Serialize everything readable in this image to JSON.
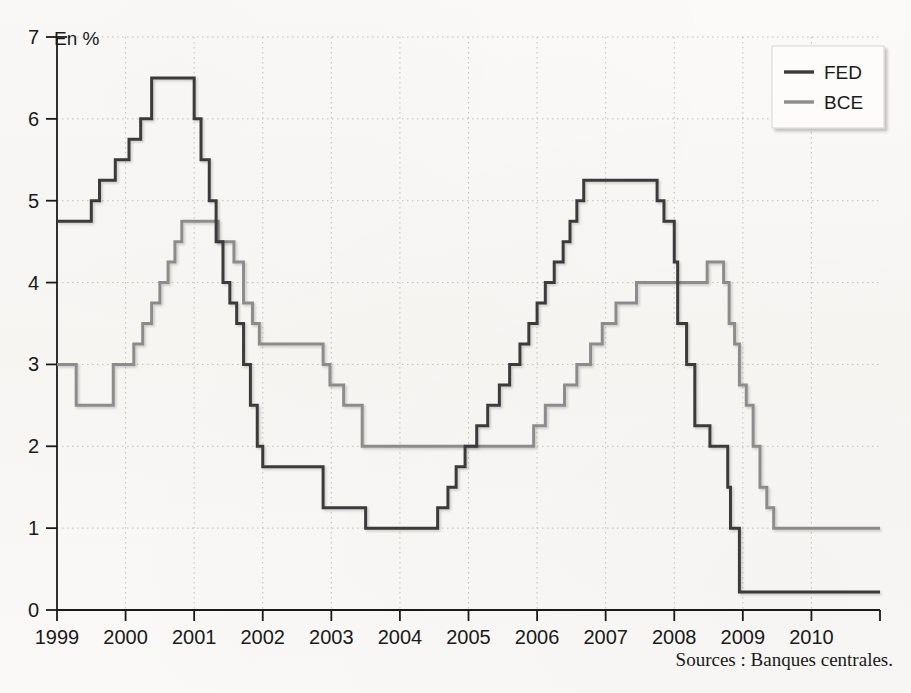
{
  "chart_data": {
    "type": "line",
    "title": "",
    "unit_label": "En %",
    "xlabel": "",
    "ylabel": "",
    "grid": true,
    "step": "post",
    "legend_position": "top-right",
    "xlim": [
      1999,
      2011
    ],
    "ylim": [
      0,
      7
    ],
    "x_ticks": [
      1999,
      2000,
      2001,
      2002,
      2003,
      2004,
      2005,
      2006,
      2007,
      2008,
      2009,
      2010
    ],
    "x_tick_labels": [
      "1999",
      "2000",
      "2001",
      "2002",
      "2003",
      "2004",
      "2005",
      "2006",
      "2007",
      "2008",
      "2009",
      "2010"
    ],
    "y_ticks": [
      0,
      1,
      2,
      3,
      4,
      5,
      6,
      7
    ],
    "y_tick_labels": [
      "0",
      "1",
      "2",
      "3",
      "4",
      "5",
      "6",
      "7"
    ],
    "series": [
      {
        "name": "FED",
        "color": "#3b3b3b",
        "width": 3.0,
        "points": [
          [
            1999.0,
            4.75
          ],
          [
            1999.5,
            5.0
          ],
          [
            1999.62,
            5.25
          ],
          [
            1999.85,
            5.5
          ],
          [
            2000.05,
            5.75
          ],
          [
            2000.22,
            6.0
          ],
          [
            2000.38,
            6.5
          ],
          [
            2001.0,
            6.0
          ],
          [
            2001.1,
            5.5
          ],
          [
            2001.22,
            5.0
          ],
          [
            2001.32,
            4.5
          ],
          [
            2001.42,
            4.0
          ],
          [
            2001.52,
            3.75
          ],
          [
            2001.62,
            3.5
          ],
          [
            2001.72,
            3.0
          ],
          [
            2001.82,
            2.5
          ],
          [
            2001.92,
            2.0
          ],
          [
            2002.0,
            1.75
          ],
          [
            2002.88,
            1.25
          ],
          [
            2003.5,
            1.0
          ],
          [
            2004.55,
            1.25
          ],
          [
            2004.7,
            1.5
          ],
          [
            2004.82,
            1.75
          ],
          [
            2004.95,
            2.0
          ],
          [
            2005.12,
            2.25
          ],
          [
            2005.28,
            2.5
          ],
          [
            2005.45,
            2.75
          ],
          [
            2005.6,
            3.0
          ],
          [
            2005.75,
            3.25
          ],
          [
            2005.88,
            3.5
          ],
          [
            2006.0,
            3.75
          ],
          [
            2006.12,
            4.0
          ],
          [
            2006.25,
            4.25
          ],
          [
            2006.38,
            4.5
          ],
          [
            2006.48,
            4.75
          ],
          [
            2006.58,
            5.0
          ],
          [
            2006.68,
            5.25
          ],
          [
            2007.75,
            5.0
          ],
          [
            2007.85,
            4.75
          ],
          [
            2008.0,
            4.25
          ],
          [
            2008.05,
            3.5
          ],
          [
            2008.18,
            3.0
          ],
          [
            2008.3,
            2.25
          ],
          [
            2008.52,
            2.0
          ],
          [
            2008.78,
            1.5
          ],
          [
            2008.82,
            1.0
          ],
          [
            2008.95,
            0.22
          ],
          [
            2011.0,
            0.22
          ]
        ]
      },
      {
        "name": "BCE",
        "color": "#8c8c8c",
        "width": 3.0,
        "points": [
          [
            1999.0,
            3.0
          ],
          [
            1999.28,
            2.5
          ],
          [
            1999.82,
            3.0
          ],
          [
            2000.12,
            3.25
          ],
          [
            2000.25,
            3.5
          ],
          [
            2000.38,
            3.75
          ],
          [
            2000.5,
            4.0
          ],
          [
            2000.62,
            4.25
          ],
          [
            2000.72,
            4.5
          ],
          [
            2000.82,
            4.75
          ],
          [
            2001.35,
            4.5
          ],
          [
            2001.58,
            4.25
          ],
          [
            2001.72,
            3.75
          ],
          [
            2001.85,
            3.5
          ],
          [
            2001.95,
            3.25
          ],
          [
            2002.88,
            3.0
          ],
          [
            2002.98,
            2.75
          ],
          [
            2003.18,
            2.5
          ],
          [
            2003.45,
            2.0
          ],
          [
            2005.95,
            2.25
          ],
          [
            2006.12,
            2.5
          ],
          [
            2006.4,
            2.75
          ],
          [
            2006.58,
            3.0
          ],
          [
            2006.78,
            3.25
          ],
          [
            2006.95,
            3.5
          ],
          [
            2007.15,
            3.75
          ],
          [
            2007.45,
            4.0
          ],
          [
            2008.48,
            4.25
          ],
          [
            2008.72,
            4.0
          ],
          [
            2008.8,
            3.5
          ],
          [
            2008.88,
            3.25
          ],
          [
            2008.95,
            2.75
          ],
          [
            2009.05,
            2.5
          ],
          [
            2009.15,
            2.0
          ],
          [
            2009.25,
            1.5
          ],
          [
            2009.35,
            1.25
          ],
          [
            2009.45,
            1.0
          ],
          [
            2011.0,
            1.0
          ]
        ]
      }
    ],
    "legend": [
      {
        "label": "FED",
        "color": "#3b3b3b"
      },
      {
        "label": "BCE",
        "color": "#8c8c8c"
      }
    ],
    "source_note": "Sources : Banques centrales."
  },
  "colors": {
    "background": "#faf9f7",
    "axis": "#1a1a1a",
    "grid": "#b9b6b0",
    "fed": "#3b3b3b",
    "bce": "#8c8c8c"
  }
}
